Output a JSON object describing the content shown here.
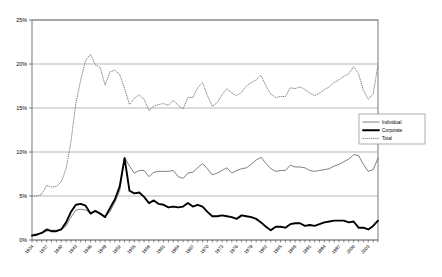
{
  "chart_data": {
    "type": "line",
    "title": "",
    "xlabel": "",
    "ylabel": "",
    "ylim": [
      0,
      25
    ],
    "ytick_labels": [
      "0%",
      "5%",
      "10%",
      "15%",
      "20%",
      "25%"
    ],
    "ytick_values": [
      0,
      5,
      10,
      15,
      20,
      25
    ],
    "grid": true,
    "legend_position": "right-middle",
    "x": [
      1934,
      1935,
      1936,
      1937,
      1938,
      1939,
      1940,
      1941,
      1942,
      1943,
      1944,
      1945,
      1946,
      1947,
      1948,
      1949,
      1950,
      1951,
      1952,
      1953,
      1954,
      1955,
      1956,
      1957,
      1958,
      1959,
      1960,
      1961,
      1962,
      1963,
      1964,
      1965,
      1966,
      1967,
      1968,
      1969,
      1970,
      1971,
      1972,
      1973,
      1974,
      1975,
      1976,
      1977,
      1978,
      1979,
      1980,
      1981,
      1982,
      1983,
      1984,
      1985,
      1986,
      1987,
      1988,
      1989,
      1990,
      1991,
      1992,
      1993,
      1994,
      1995,
      1996,
      1997,
      1998,
      1999,
      2000,
      2001,
      2002,
      2003,
      2004,
      2005
    ],
    "xtick_labels": [
      "1934",
      "1937",
      "1940",
      "1943",
      "1946",
      "1949",
      "1952",
      "1955",
      "1958",
      "1961",
      "1964",
      "1967",
      "1970",
      "1973",
      "1976",
      "1979",
      "1982",
      "1985",
      "1988",
      "1991",
      "1994",
      "1997",
      "2000",
      "2003"
    ],
    "xtick_step": 3,
    "series": [
      {
        "name": "Individual",
        "style": "thin-solid",
        "color": "#555555",
        "values": [
          0.6,
          0.7,
          0.8,
          1.0,
          1.1,
          1.1,
          1.2,
          1.6,
          2.6,
          3.4,
          3.5,
          3.4,
          3.1,
          3.3,
          2.9,
          2.7,
          3.2,
          4.3,
          5.6,
          9.4,
          8.4,
          7.6,
          7.9,
          7.9,
          7.2,
          7.7,
          7.8,
          7.8,
          7.8,
          7.9,
          7.2,
          7.0,
          7.6,
          7.7,
          8.2,
          8.7,
          8.1,
          7.4,
          7.6,
          7.9,
          8.2,
          7.6,
          7.9,
          8.1,
          8.2,
          8.6,
          9.1,
          9.4,
          8.7,
          8.1,
          7.8,
          7.9,
          7.9,
          8.5,
          8.3,
          8.3,
          8.2,
          7.9,
          7.8,
          7.9,
          8.0,
          8.1,
          8.4,
          8.6,
          8.9,
          9.2,
          9.7,
          9.6,
          8.6,
          7.8,
          8.0,
          9.3
        ]
      },
      {
        "name": "Corporate",
        "style": "thick-solid",
        "color": "#000000",
        "values": [
          0.5,
          0.6,
          0.8,
          1.2,
          1.0,
          1.0,
          1.2,
          2.0,
          3.2,
          4.0,
          4.1,
          3.9,
          3.0,
          3.3,
          3.0,
          2.6,
          3.6,
          4.6,
          6.1,
          9.3,
          5.6,
          5.3,
          5.4,
          4.9,
          4.2,
          4.5,
          4.1,
          4.0,
          3.7,
          3.8,
          3.7,
          3.8,
          4.2,
          3.8,
          4.0,
          3.8,
          3.2,
          2.7,
          2.7,
          2.8,
          2.7,
          2.6,
          2.4,
          2.8,
          2.7,
          2.6,
          2.4,
          2.0,
          1.5,
          1.1,
          1.5,
          1.5,
          1.4,
          1.8,
          1.9,
          1.9,
          1.6,
          1.7,
          1.6,
          1.8,
          2.0,
          2.1,
          2.2,
          2.2,
          2.2,
          2.0,
          2.1,
          1.4,
          1.4,
          1.2,
          1.6,
          2.2
        ]
      },
      {
        "name": "Total",
        "style": "dotted",
        "color": "#777777",
        "values": [
          5.0,
          5.0,
          5.2,
          6.2,
          6.0,
          6.1,
          6.6,
          8.1,
          11.2,
          15.5,
          18.2,
          20.4,
          21.1,
          19.9,
          19.6,
          17.6,
          19.1,
          19.3,
          18.8,
          17.2,
          15.4,
          16.1,
          16.5,
          16.0,
          14.7,
          15.2,
          15.4,
          15.5,
          15.3,
          15.9,
          15.3,
          14.9,
          16.2,
          16.2,
          17.3,
          17.9,
          16.4,
          15.2,
          15.6,
          16.5,
          17.2,
          16.7,
          16.4,
          16.8,
          17.5,
          17.9,
          18.2,
          18.7,
          17.5,
          16.6,
          16.2,
          16.3,
          16.3,
          17.3,
          17.2,
          17.4,
          17.1,
          16.7,
          16.4,
          16.7,
          17.1,
          17.4,
          17.9,
          18.2,
          18.6,
          18.9,
          19.7,
          18.9,
          17.0,
          16.0,
          16.6,
          19.9
        ]
      }
    ]
  },
  "legend": {
    "entries": [
      {
        "label": "Individual"
      },
      {
        "label": "Corporate"
      },
      {
        "label": "Total"
      }
    ]
  }
}
